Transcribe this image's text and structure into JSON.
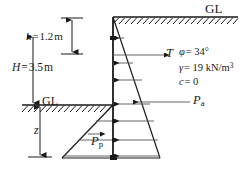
{
  "diagram": {
    "ground_line_top_label": "GL",
    "ground_line_lower_label": "GL",
    "dimensions": {
      "wall_height_symbol": "H",
      "wall_height_value": "3.5",
      "wall_height_unit": "m",
      "wall_height_text": "H = 3.5 m",
      "anchor_depth_symbol": "h",
      "anchor_depth_value": "1.2",
      "anchor_depth_unit": "m",
      "anchor_depth_text": "h = 1.2 m",
      "embedment_symbol": "z"
    },
    "forces": {
      "tie_rod": "T",
      "active_pressure": "Pa",
      "active_pressure_symbol": "P",
      "active_pressure_subscript": "a",
      "passive_pressure": "Pp",
      "passive_pressure_symbol": "P",
      "passive_pressure_subscript": "p"
    },
    "soil_properties": {
      "friction_angle_symbol": "φ",
      "friction_angle_text": "= 34°",
      "friction_angle_value": "34",
      "unit_weight_symbol": "γ",
      "unit_weight_text": "= 19 kN/m",
      "unit_weight_exponent": "3",
      "unit_weight_value": "19",
      "unit_weight_unit": "kN/m3",
      "cohesion_symbol": "c",
      "cohesion_text": "= 0",
      "cohesion_value": "0"
    },
    "colors": {
      "line": "#1a1a1a",
      "background": "#ffffff",
      "thin_line": "#444444"
    }
  }
}
